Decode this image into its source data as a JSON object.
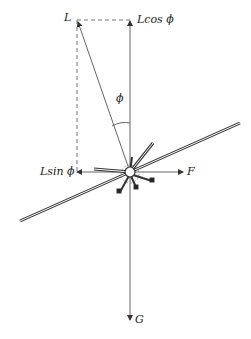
{
  "diagram": {
    "type": "free-body force diagram",
    "labels": {
      "lift": "L",
      "lift_vertical": "Lcos ϕ",
      "lift_horizontal": "Lsin ϕ",
      "angle": "ϕ",
      "centrifugal": "F",
      "gravity": "G"
    },
    "colors": {
      "line": "#555555",
      "dashed": "#777777",
      "rotor": "#333333"
    }
  }
}
